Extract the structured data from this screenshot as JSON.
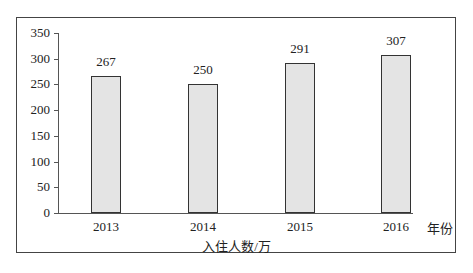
{
  "chart_data": {
    "type": "bar",
    "categories": [
      "2013",
      "2014",
      "2015",
      "2016"
    ],
    "values": [
      267,
      250,
      291,
      307
    ],
    "title": "",
    "xlabel": "年份",
    "ylabel": "入住人数/万",
    "ylim": [
      0,
      350
    ],
    "yticks": [
      "0",
      "50",
      "100",
      "150",
      "200",
      "250",
      "300",
      "350"
    ],
    "grid": false,
    "legend": null
  },
  "labels": {
    "x_unit": "年份",
    "y_title": "入住人数/万"
  },
  "colors": {
    "bar_fill": "#e4e4e4",
    "bar_border": "#333333"
  }
}
